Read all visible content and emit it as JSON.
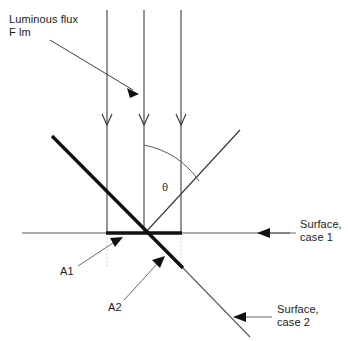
{
  "diagram": {
    "colors": {
      "line": "#1a1a1a",
      "thin_line": "#4a4a4a",
      "dotted_line": "#bdbdbd",
      "text": "#1a1a1a",
      "background": "#ffffff"
    },
    "labels": {
      "luminous_flux_line1": "Luminous flux",
      "luminous_flux_line2": "F lm",
      "theta": "θ",
      "area_1": "A1",
      "area_2": "A2",
      "surface_case1_line1": "Surface,",
      "surface_case1_line2": "case 1",
      "surface_case2_line1": "Surface,",
      "surface_case2_line2": "case 2"
    },
    "geometry": {
      "intersection": {
        "x": 145,
        "y": 233
      },
      "surface_line_case1": {
        "x1": 22,
        "y1": 233,
        "x2": 290,
        "y2": 233
      },
      "incident_rays_x": [
        107,
        144,
        181
      ],
      "incident_ray_top_y": 10,
      "incident_ray_arrow_y": 122,
      "thick_segment_a1": {
        "x1": 106,
        "y1": 233,
        "x2": 182,
        "y2": 233
      },
      "thick_segment_a2": {
        "x1": 52,
        "y1": 136,
        "x2": 183,
        "y2": 268
      },
      "surface_case2_thin": {
        "x1": 183,
        "y1": 268,
        "x2": 250,
        "y2": 337
      },
      "reflected_ray": {
        "x1": 145,
        "y1": 233,
        "x2": 240,
        "y2": 130
      },
      "theta_arc_start": {
        "x": 144,
        "y": 145
      },
      "theta_arc_end": {
        "x": 199,
        "y": 181
      },
      "dotted_verticals_x": [
        107,
        181
      ],
      "dotted_vertical_bottom_y": 268
    },
    "annotations": [
      {
        "name": "luminous-flux-pointer",
        "x1": 50,
        "y1": 40,
        "x2": 138,
        "y2": 94
      },
      {
        "name": "a1-pointer",
        "x1": 78,
        "y1": 266,
        "x2": 122,
        "y2": 238
      },
      {
        "name": "a2-pointer",
        "x1": 124,
        "y1": 300,
        "x2": 164,
        "y2": 258
      },
      {
        "name": "surface-case1-pointer",
        "x1": 296,
        "y1": 233,
        "x2": 258,
        "y2": 233
      },
      {
        "name": "surface-case2-pointer",
        "x1": 272,
        "y1": 317,
        "x2": 234,
        "y2": 317
      }
    ]
  }
}
